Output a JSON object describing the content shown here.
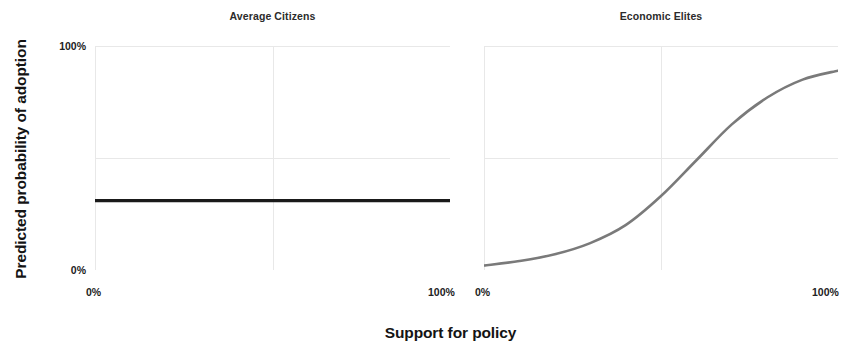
{
  "figure": {
    "x_axis_title": "Support for policy",
    "y_axis_title": "Predicted probability of adoption"
  },
  "panels": [
    {
      "title": "Average Citizens",
      "x_ticks": [
        "0%",
        "100%"
      ]
    },
    {
      "title": "Economic Elites",
      "x_ticks": [
        "0%",
        "100%"
      ]
    }
  ],
  "y_ticks": [
    "100%",
    "0%"
  ],
  "colors": {
    "average_citizens_line": "#1a1a1a",
    "economic_elites_line": "#7a7a7a",
    "gridline": "#e8e8e8",
    "panel_background": "#ffffff",
    "text": "#1a1a1a"
  },
  "chart_data": {
    "type": "line",
    "title": "",
    "xlabel": "Support for policy",
    "ylabel": "Predicted probability of adoption",
    "xlim": [
      0,
      100
    ],
    "ylim": [
      0,
      100
    ],
    "x_tick_labels": [
      "0%",
      "100%"
    ],
    "y_tick_labels": [
      "0%",
      "100%"
    ],
    "grid": true,
    "grid_y_values": [
      0,
      50,
      100
    ],
    "grid_x_values": [
      0,
      50,
      100
    ],
    "legend": "none",
    "facets": [
      {
        "name": "Average Citizens",
        "series": [
          {
            "name": "Predicted probability of adoption",
            "color": "#1a1a1a",
            "x": [
              0,
              10,
              20,
              30,
              40,
              50,
              60,
              70,
              80,
              90,
              100
            ],
            "values": [
              31,
              31,
              31,
              31,
              31,
              31,
              31,
              31,
              31,
              31,
              31
            ]
          }
        ]
      },
      {
        "name": "Economic Elites",
        "series": [
          {
            "name": "Predicted probability of adoption",
            "color": "#7a7a7a",
            "x": [
              0,
              10,
              20,
              30,
              40,
              50,
              60,
              70,
              80,
              90,
              100
            ],
            "values": [
              2,
              4,
              7,
              12,
              20,
              33,
              49,
              65,
              77,
              85,
              89
            ]
          }
        ]
      }
    ]
  }
}
